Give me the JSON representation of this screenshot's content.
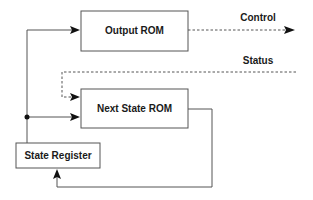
{
  "diagram": {
    "type": "block-diagram",
    "nodes": [
      {
        "id": "output_rom",
        "label": "Output ROM"
      },
      {
        "id": "next_state_rom",
        "label": "Next State ROM"
      },
      {
        "id": "state_register",
        "label": "State Register"
      }
    ],
    "signals": {
      "control": "Control",
      "status": "Status"
    },
    "edges": [
      {
        "from": "state_register",
        "to": "output_rom",
        "style": "solid"
      },
      {
        "from": "state_register",
        "to": "next_state_rom",
        "style": "solid"
      },
      {
        "from": "output_rom",
        "to": "control",
        "style": "dashed",
        "label": "Control"
      },
      {
        "from": "status",
        "to": "next_state_rom",
        "style": "dashed",
        "label": "Status"
      },
      {
        "from": "next_state_rom",
        "to": "state_register",
        "style": "solid"
      }
    ],
    "colors": {
      "stroke": "#555555",
      "arrow": "#111111",
      "text": "#1a1a1a",
      "background": "#ffffff"
    }
  }
}
